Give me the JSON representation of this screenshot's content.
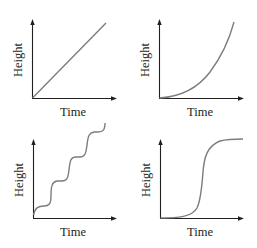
{
  "figure": {
    "panels": [
      {
        "id": "linear",
        "xlabel": "Time",
        "ylabel": "Height",
        "curve": "linear"
      },
      {
        "id": "accelerating",
        "xlabel": "Time",
        "ylabel": "Height",
        "curve": "exponential"
      },
      {
        "id": "stepwise",
        "xlabel": "Time",
        "ylabel": "Height",
        "curve": "staircase"
      },
      {
        "id": "sigmoid",
        "xlabel": "Time",
        "ylabel": "Height",
        "curve": "sigmoid"
      }
    ],
    "colors": {
      "axis": "#231f20",
      "curve": "#7d7d7d",
      "background": "#ffffff"
    }
  }
}
